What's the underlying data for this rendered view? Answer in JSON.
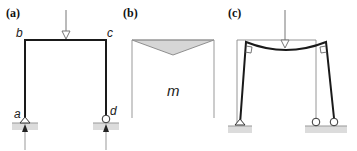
{
  "panels": [
    {
      "id": "a",
      "label": "(a)",
      "description": "Portal frame with point load on beam, pinned at a, roller at d",
      "nodes": {
        "a": "a",
        "b": "b",
        "c": "c",
        "d": "d"
      }
    },
    {
      "id": "b",
      "label": "(b)",
      "description": "Moment diagram",
      "moment_label": "m"
    },
    {
      "id": "c",
      "label": "(c)",
      "description": "Deflected shape of frame"
    }
  ],
  "colors": {
    "member": "#1a1a1a",
    "undeformed": "#8a8a8a",
    "moment_fill": "#d6d6d6",
    "ground": "#d9d9d9",
    "load_arrow": "#777777"
  }
}
